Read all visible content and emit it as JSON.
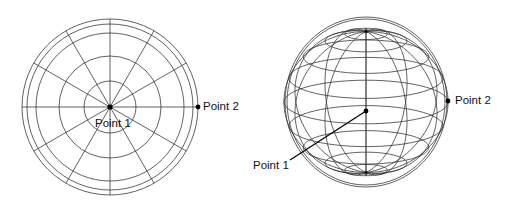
{
  "figures": [
    {
      "id": "flat-polar-grid",
      "description": "Flat polar grid (azimuthal projection) with concentric rings and 12 radial spokes",
      "center": [
        110,
        107
      ],
      "ring_radii": [
        26,
        51,
        74,
        83,
        88
      ],
      "spoke_count": 12,
      "points": [
        {
          "label": "Point 1",
          "position": [
            110,
            107
          ]
        },
        {
          "label": "Point 2",
          "position": [
            198,
            107
          ]
        }
      ]
    },
    {
      "id": "sphere-wireframe",
      "description": "Wireframe sphere viewed obliquely with poles at top and bottom",
      "center": [
        366,
        102
      ],
      "radius": 81,
      "points": [
        {
          "label": "Point 1",
          "position": [
            366,
            111
          ]
        },
        {
          "label": "Point 2",
          "position": [
            448,
            101
          ]
        }
      ]
    }
  ],
  "labels": {
    "left_point1": "Point 1",
    "left_point2": "Point 2",
    "right_point1": "Point 1",
    "right_point2": "Point 2"
  },
  "colors": {
    "line": "#333333",
    "dot": "#000000",
    "background": "#ffffff"
  }
}
